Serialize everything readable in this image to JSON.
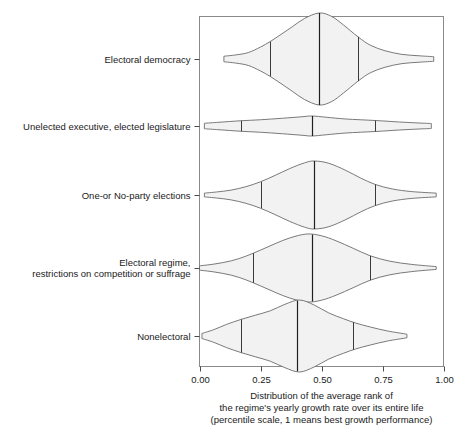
{
  "chart_data": {
    "type": "violin",
    "title": "",
    "xlabel": "Distribution of the average rank of the regime's yearly growth rate over its entire life (percentile scale, 1 means best growth performance)",
    "ylabel": "",
    "xlim": [
      0.0,
      1.0
    ],
    "grid": false,
    "legend": "none",
    "xticks": [
      0.0,
      0.25,
      0.5,
      0.75,
      1.0
    ],
    "xtick_labels": [
      "0.00",
      "0.25",
      "0.50",
      "0.75",
      "1.00"
    ],
    "categories": [
      "Electoral democracy",
      "Unelected executive, elected legislature",
      "One-or No-party elections",
      "Electoral regime, restrictions on competition or suffrage",
      "Nonelectoral"
    ],
    "series": [
      {
        "name": "Electoral democracy",
        "min": 0.1,
        "q1": 0.29,
        "median": 0.49,
        "q3": 0.65,
        "max": 0.96,
        "peak": 0.49,
        "max_width": 1.0,
        "density": [
          {
            "x": 0.1,
            "w": 0.06
          },
          {
            "x": 0.15,
            "w": 0.09
          },
          {
            "x": 0.2,
            "w": 0.14
          },
          {
            "x": 0.25,
            "w": 0.26
          },
          {
            "x": 0.29,
            "w": 0.38
          },
          {
            "x": 0.33,
            "w": 0.52
          },
          {
            "x": 0.38,
            "w": 0.7
          },
          {
            "x": 0.43,
            "w": 0.88
          },
          {
            "x": 0.49,
            "w": 1.0
          },
          {
            "x": 0.54,
            "w": 0.93
          },
          {
            "x": 0.59,
            "w": 0.74
          },
          {
            "x": 0.65,
            "w": 0.48
          },
          {
            "x": 0.7,
            "w": 0.3
          },
          {
            "x": 0.76,
            "w": 0.18
          },
          {
            "x": 0.83,
            "w": 0.1
          },
          {
            "x": 0.9,
            "w": 0.07
          },
          {
            "x": 0.96,
            "w": 0.05
          }
        ]
      },
      {
        "name": "Unelected executive, elected legislature",
        "min": 0.02,
        "q1": 0.17,
        "median": 0.46,
        "q3": 0.72,
        "max": 0.95,
        "peak": 0.46,
        "max_width": 0.2,
        "density": [
          {
            "x": 0.02,
            "w": 0.055
          },
          {
            "x": 0.08,
            "w": 0.075
          },
          {
            "x": 0.17,
            "w": 0.105
          },
          {
            "x": 0.25,
            "w": 0.125
          },
          {
            "x": 0.34,
            "w": 0.155
          },
          {
            "x": 0.42,
            "w": 0.185
          },
          {
            "x": 0.46,
            "w": 0.2
          },
          {
            "x": 0.52,
            "w": 0.175
          },
          {
            "x": 0.6,
            "w": 0.14
          },
          {
            "x": 0.72,
            "w": 0.11
          },
          {
            "x": 0.82,
            "w": 0.08
          },
          {
            "x": 0.9,
            "w": 0.06
          },
          {
            "x": 0.95,
            "w": 0.05
          }
        ]
      },
      {
        "name": "One-or No-party elections",
        "min": 0.02,
        "q1": 0.25,
        "median": 0.47,
        "q3": 0.72,
        "max": 0.97,
        "peak": 0.47,
        "max_width": 0.9,
        "density": [
          {
            "x": 0.02,
            "w": 0.05
          },
          {
            "x": 0.07,
            "w": 0.08
          },
          {
            "x": 0.13,
            "w": 0.13
          },
          {
            "x": 0.19,
            "w": 0.22
          },
          {
            "x": 0.25,
            "w": 0.35
          },
          {
            "x": 0.31,
            "w": 0.52
          },
          {
            "x": 0.37,
            "w": 0.7
          },
          {
            "x": 0.43,
            "w": 0.85
          },
          {
            "x": 0.47,
            "w": 0.9
          },
          {
            "x": 0.53,
            "w": 0.84
          },
          {
            "x": 0.6,
            "w": 0.65
          },
          {
            "x": 0.66,
            "w": 0.45
          },
          {
            "x": 0.72,
            "w": 0.28
          },
          {
            "x": 0.79,
            "w": 0.16
          },
          {
            "x": 0.87,
            "w": 0.09
          },
          {
            "x": 0.97,
            "w": 0.05
          }
        ]
      },
      {
        "name": "Electoral regime, restrictions on competition or suffrage",
        "min": 0.0,
        "q1": 0.22,
        "median": 0.46,
        "q3": 0.7,
        "max": 0.97,
        "peak": 0.44,
        "max_width": 0.95,
        "density": [
          {
            "x": 0.0,
            "w": 0.06
          },
          {
            "x": 0.06,
            "w": 0.11
          },
          {
            "x": 0.13,
            "w": 0.2
          },
          {
            "x": 0.19,
            "w": 0.33
          },
          {
            "x": 0.25,
            "w": 0.5
          },
          {
            "x": 0.31,
            "w": 0.68
          },
          {
            "x": 0.37,
            "w": 0.84
          },
          {
            "x": 0.44,
            "w": 0.95
          },
          {
            "x": 0.5,
            "w": 0.9
          },
          {
            "x": 0.56,
            "w": 0.76
          },
          {
            "x": 0.63,
            "w": 0.55
          },
          {
            "x": 0.7,
            "w": 0.34
          },
          {
            "x": 0.78,
            "w": 0.19
          },
          {
            "x": 0.87,
            "w": 0.1
          },
          {
            "x": 0.97,
            "w": 0.04
          }
        ]
      },
      {
        "name": "Nonelectoral",
        "min": 0.01,
        "q1": 0.17,
        "median": 0.4,
        "q3": 0.63,
        "max": 0.85,
        "peak": 0.41,
        "max_width": 1.0,
        "density": [
          {
            "x": 0.01,
            "w": 0.07
          },
          {
            "x": 0.06,
            "w": 0.18
          },
          {
            "x": 0.11,
            "w": 0.32
          },
          {
            "x": 0.17,
            "w": 0.46
          },
          {
            "x": 0.23,
            "w": 0.58
          },
          {
            "x": 0.29,
            "w": 0.7
          },
          {
            "x": 0.35,
            "w": 0.88
          },
          {
            "x": 0.41,
            "w": 1.0
          },
          {
            "x": 0.47,
            "w": 0.86
          },
          {
            "x": 0.53,
            "w": 0.64
          },
          {
            "x": 0.59,
            "w": 0.48
          },
          {
            "x": 0.64,
            "w": 0.36
          },
          {
            "x": 0.7,
            "w": 0.25
          },
          {
            "x": 0.77,
            "w": 0.14
          },
          {
            "x": 0.85,
            "w": 0.05
          }
        ]
      }
    ],
    "axis_caption_lines": [
      "Distribution of the average rank of",
      "the regime's yearly growth rate over its entire life",
      "(percentile scale, 1 means best growth performance)"
    ]
  },
  "category_label_lines": [
    [
      "Electoral democracy"
    ],
    [
      "Unelected executive, elected legislature"
    ],
    [
      "One-or No-party elections"
    ],
    [
      "Electoral regime,",
      "restrictions on competition or suffrage"
    ],
    [
      "Nonelectoral"
    ]
  ],
  "colors": {
    "violin_fill": "#f2f2f2",
    "violin_stroke": "#6b6b6b",
    "quartile": "#3a3a3a",
    "frame": "#8a8a8a",
    "text": "#1a1a1a"
  }
}
